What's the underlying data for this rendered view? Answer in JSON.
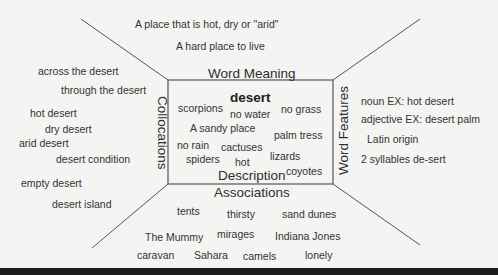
{
  "diagram": {
    "type": "word-map (Frayer-style vocabulary organizer)",
    "center_word": "desert",
    "sections": {
      "top": {
        "heading": "Word Meaning",
        "items": [
          "A place that is hot, dry or \"arid\"",
          "A hard place to live"
        ]
      },
      "left": {
        "heading": "Collocations",
        "items": [
          "across the desert",
          "through the desert",
          "hot desert",
          "dry desert",
          "arid desert",
          "desert condition",
          "empty desert",
          "desert island"
        ]
      },
      "right": {
        "heading": "Word Features",
        "items": [
          "noun EX: hot desert",
          "adjective EX: desert palm",
          "Latin origin",
          "2 syllables de-sert"
        ]
      },
      "bottom": {
        "heading": "Associations",
        "items": [
          "tents",
          "thirsty",
          "sand dunes",
          "The Mummy",
          "mirages",
          "Indiana Jones",
          "caravan",
          "Sahara",
          "camels",
          "lonely"
        ]
      },
      "center": {
        "heading": "Description",
        "items": [
          "scorpions",
          "no water",
          "no grass",
          "A sandy place",
          "palm tress",
          "no rain",
          "cactuses",
          "lizards",
          "spiders",
          "hot",
          "coyotes"
        ]
      }
    },
    "colors": {
      "background": "#f4f4f2",
      "lines": "#555555",
      "text": "#333333",
      "bottom_band": "#1c1c1c"
    }
  }
}
